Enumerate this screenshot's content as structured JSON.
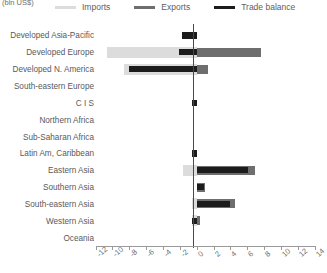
{
  "unit_label": "(bln US$)",
  "legend": {
    "items": [
      {
        "label": "Imports",
        "color": "#dcdcdc",
        "icon": "line-swatch-icon"
      },
      {
        "label": "Exports",
        "color": "#6e6e6e",
        "icon": "line-swatch-icon"
      },
      {
        "label": "Trade balance",
        "color": "#1c1c1c",
        "icon": "line-swatch-icon"
      }
    ]
  },
  "axis": {
    "ticks": [
      "-12",
      "-10",
      "-8",
      "-6",
      "-4",
      "-2",
      "0",
      "2",
      "4",
      "6",
      "8",
      "10",
      "12",
      "14"
    ]
  },
  "chart_data": {
    "type": "bar",
    "orientation": "horizontal",
    "title": "",
    "subtitle": "",
    "xlabel": "(bln US$)",
    "ylabel": "",
    "xlim": [
      -12,
      14
    ],
    "xticks": [
      -12,
      -10,
      -8,
      -6,
      -4,
      -2,
      0,
      2,
      4,
      6,
      8,
      10,
      12,
      14
    ],
    "grid": false,
    "legend_position": "top",
    "categories": [
      "Developed Asia-Pacific",
      "Developed Europe",
      "Developed N. America",
      "South-eastern Europe",
      "C I S",
      "Northern Africa",
      "Sub-Saharan Africa",
      "Latin Am, Caribbean",
      "Eastern Asia",
      "Southern Asia",
      "South-eastern Asia",
      "Western Asia",
      "Oceania"
    ],
    "series": [
      {
        "name": "Imports",
        "color": "#dcdcdc",
        "values": [
          0.0,
          -10.6,
          -8.6,
          0.0,
          0.0,
          0.0,
          0.0,
          0.0,
          -1.6,
          0.0,
          -0.6,
          -0.5,
          0.0
        ]
      },
      {
        "name": "Exports",
        "color": "#6e6e6e",
        "values": [
          0.0,
          7.6,
          1.4,
          0.0,
          0.0,
          0.0,
          0.0,
          0.0,
          6.9,
          1.0,
          4.6,
          0.4,
          0.0
        ]
      },
      {
        "name": "Trade balance",
        "color": "#1c1c1c",
        "values": [
          -1.7,
          -2.1,
          -8.0,
          0.0,
          -0.6,
          0.0,
          0.0,
          -0.5,
          6.1,
          0.9,
          4.0,
          -0.6,
          0.0
        ]
      }
    ]
  }
}
